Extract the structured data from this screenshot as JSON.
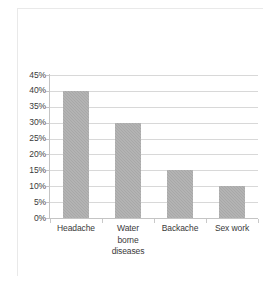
{
  "chart_data": {
    "type": "bar",
    "title": "",
    "subtitle": "",
    "xlabel": "",
    "ylabel": "",
    "categories": [
      "Headache",
      "Water borne diseases",
      "Backache",
      "Sex work"
    ],
    "category_lines": [
      [
        "Headache"
      ],
      [
        "Water",
        "borne",
        "diseases"
      ],
      [
        "Backache"
      ],
      [
        "Sex work"
      ]
    ],
    "values": [
      40,
      30,
      15,
      10
    ],
    "value_labels": [
      "40%",
      "30%",
      "15%",
      "10%"
    ],
    "ylim": [
      0,
      45
    ],
    "ytick_step": 5,
    "ytick_labels": [
      "45%",
      "40%",
      "35%",
      "30%",
      "25%",
      "20%",
      "15%",
      "10%",
      "5%",
      "0%"
    ],
    "ytick_values": [
      45,
      40,
      35,
      30,
      25,
      20,
      15,
      10,
      5,
      0
    ],
    "grid": true,
    "legend": false,
    "legend_position": "none",
    "series": [
      {
        "name": "",
        "values": [
          40,
          30,
          15,
          10
        ]
      }
    ],
    "colors": {
      "bar_fill": "#a8a8a8",
      "gridline": "#d8d8d8",
      "axis_line": "#c4c4c4",
      "text": "#3a3a3a",
      "background": "#ffffff",
      "border": "#e9e9e9"
    }
  }
}
